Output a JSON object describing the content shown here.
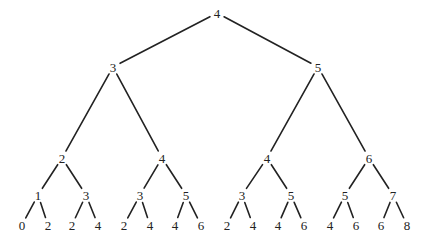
{
  "diagram": {
    "type": "binary-tree",
    "line_color": "#222222",
    "nodes": [
      {
        "id": "n0",
        "label": "4",
        "x": 217,
        "y": 13
      },
      {
        "id": "n1",
        "label": "3",
        "x": 113,
        "y": 67
      },
      {
        "id": "n2",
        "label": "5",
        "x": 318,
        "y": 67
      },
      {
        "id": "n3",
        "label": "2",
        "x": 62,
        "y": 158
      },
      {
        "id": "n4",
        "label": "4",
        "x": 162,
        "y": 158
      },
      {
        "id": "n5",
        "label": "4",
        "x": 267,
        "y": 158
      },
      {
        "id": "n6",
        "label": "6",
        "x": 369,
        "y": 158
      },
      {
        "id": "n7",
        "label": "1",
        "x": 38,
        "y": 195
      },
      {
        "id": "n8",
        "label": "3",
        "x": 86,
        "y": 195
      },
      {
        "id": "n9",
        "label": "3",
        "x": 140,
        "y": 195
      },
      {
        "id": "n10",
        "label": "5",
        "x": 186,
        "y": 195
      },
      {
        "id": "n11",
        "label": "3",
        "x": 242,
        "y": 195
      },
      {
        "id": "n12",
        "label": "5",
        "x": 291,
        "y": 195
      },
      {
        "id": "n13",
        "label": "5",
        "x": 345,
        "y": 195
      },
      {
        "id": "n14",
        "label": "7",
        "x": 393,
        "y": 195
      },
      {
        "id": "n15",
        "label": "0",
        "x": 22,
        "y": 225
      },
      {
        "id": "n16",
        "label": "2",
        "x": 48,
        "y": 225
      },
      {
        "id": "n17",
        "label": "2",
        "x": 72,
        "y": 225
      },
      {
        "id": "n18",
        "label": "4",
        "x": 98,
        "y": 225
      },
      {
        "id": "n19",
        "label": "2",
        "x": 124,
        "y": 225
      },
      {
        "id": "n20",
        "label": "4",
        "x": 150,
        "y": 225
      },
      {
        "id": "n21",
        "label": "4",
        "x": 175,
        "y": 225
      },
      {
        "id": "n22",
        "label": "6",
        "x": 201,
        "y": 225
      },
      {
        "id": "n23",
        "label": "2",
        "x": 227,
        "y": 225
      },
      {
        "id": "n24",
        "label": "4",
        "x": 253,
        "y": 225
      },
      {
        "id": "n25",
        "label": "4",
        "x": 278,
        "y": 225
      },
      {
        "id": "n26",
        "label": "6",
        "x": 304,
        "y": 225
      },
      {
        "id": "n27",
        "label": "4",
        "x": 330,
        "y": 225
      },
      {
        "id": "n28",
        "label": "6",
        "x": 356,
        "y": 225
      },
      {
        "id": "n29",
        "label": "6",
        "x": 381,
        "y": 225
      },
      {
        "id": "n30",
        "label": "8",
        "x": 407,
        "y": 225
      }
    ]
  }
}
